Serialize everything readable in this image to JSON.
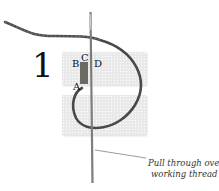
{
  "figure": {
    "step_number": "1",
    "points": {
      "a": "A",
      "b": "B",
      "c": "C",
      "d": "D"
    },
    "caption": {
      "line1": "Pull through over",
      "line2": "working thread"
    },
    "colors": {
      "thread": "#4a4a44",
      "needle": "#8a8a8a",
      "canvas": "#e9e9e9"
    }
  }
}
